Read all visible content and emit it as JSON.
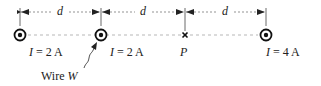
{
  "diagram": {
    "distance_label": "d",
    "spacings": [
      "d",
      "d",
      "d"
    ],
    "wires": [
      {
        "id": "wire-1",
        "current_label": "I = 2 A",
        "current_symbol": "I",
        "current_value": "= 2 A",
        "direction": "out-of-page"
      },
      {
        "id": "wire-W",
        "current_label": "I = 2 A",
        "current_symbol": "I",
        "current_value": "= 2 A",
        "direction": "out-of-page",
        "name": "Wire W"
      },
      {
        "id": "wire-3",
        "current_label": "I = 4 A",
        "current_symbol": "I",
        "current_value": "= 4 A",
        "direction": "out-of-page"
      }
    ],
    "point": {
      "label": "P",
      "marker": "×"
    },
    "wire_w_label": {
      "prefix": "Wire ",
      "symbol": "W"
    },
    "colors": {
      "ink": "#222222",
      "dashed": "#999999"
    }
  }
}
